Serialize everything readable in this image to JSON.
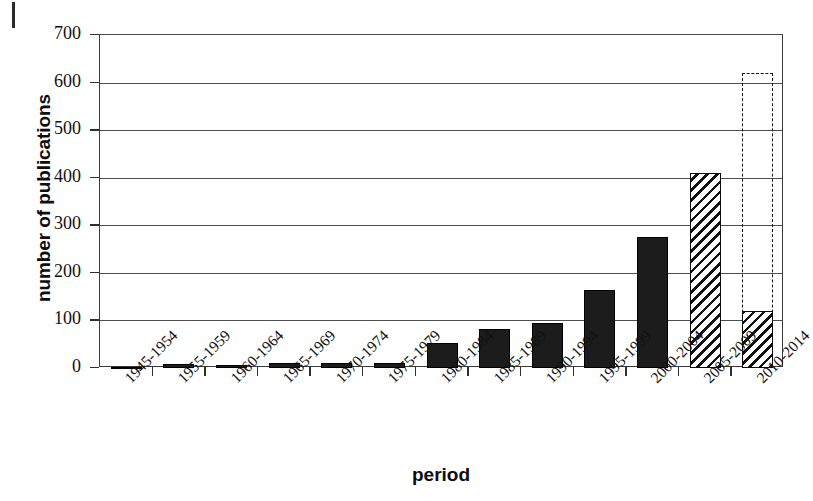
{
  "figure": {
    "page_mark": "binding-edge-mark"
  },
  "chart_data": {
    "type": "bar",
    "title": "",
    "xlabel": "period",
    "ylabel": "number of publications",
    "categories": [
      "1945-1954",
      "1955-1959",
      "1960-1964",
      "1965-1969",
      "1970-1974",
      "1975-1979",
      "1980-1984",
      "1985-1989",
      "1990-1994",
      "1995-1999",
      "2000-2004",
      "2005-2009",
      "2010-2014"
    ],
    "values": [
      2,
      8,
      7,
      10,
      10,
      11,
      52,
      82,
      95,
      163,
      275,
      410,
      120
    ],
    "bar_styles": [
      "solid",
      "solid",
      "solid",
      "solid",
      "solid",
      "solid",
      "solid",
      "solid",
      "solid",
      "solid",
      "solid",
      "hatch",
      "hatch"
    ],
    "projected": {
      "category": "2010-2014",
      "value": 620,
      "style": "dashed-outline"
    },
    "ylim": [
      0,
      700
    ],
    "yticks": [
      0,
      100,
      200,
      300,
      400,
      500,
      600,
      700
    ],
    "ytick_labels": [
      "0",
      "100",
      "200",
      "300",
      "400",
      "500",
      "600",
      "700"
    ],
    "grid": "horizontal",
    "legend": "none",
    "colors": {
      "bar_solid": "#1c1c1c",
      "bar_hatch": "#111111",
      "axis": "#2f2f2f",
      "gridline": "#4e4e4e",
      "background": "#ffffff",
      "text": "#111111"
    }
  }
}
